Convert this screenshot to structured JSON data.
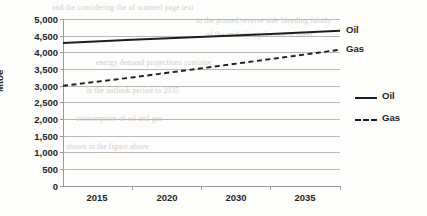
{
  "chart_data": {
    "type": "line",
    "title": "",
    "xlabel": "",
    "ylabel": "Mtoe",
    "x": [
      "2015",
      "2020",
      "2030",
      "2035"
    ],
    "xtick_labels": [
      "2015",
      "2020",
      "2030",
      "2035"
    ],
    "ytick_labels": [
      "5,000",
      "4,500",
      "4,000",
      "3,500",
      "3,000",
      "2,500",
      "2,000",
      "1,500",
      "1,000",
      "500",
      "0"
    ],
    "ylim": [
      0,
      5000
    ],
    "ytick_values": [
      5000,
      4500,
      4000,
      3500,
      3000,
      2500,
      2000,
      1500,
      1000,
      500,
      0
    ],
    "grid": true,
    "legend_position": "right",
    "series": [
      {
        "name": "Oil",
        "style": "solid",
        "color": "#1d1d1d",
        "values": [
          4280,
          4380,
          4550,
          4650
        ],
        "end_label": "Oil"
      },
      {
        "name": "Gas",
        "style": "dashed",
        "color": "#1d1d1d",
        "values": [
          3000,
          3250,
          3800,
          4080
        ],
        "end_label": "Gas"
      }
    ],
    "annotations": [
      {
        "text": "Oil",
        "series": "Oil"
      },
      {
        "text": "Gas",
        "series": "Gas"
      }
    ]
  },
  "legend": {
    "items": [
      {
        "label": "Oil",
        "style": "solid"
      },
      {
        "label": "Gas",
        "style": "dashed"
      }
    ]
  },
  "background_text": [
    "and the considering the of scanned page text",
    "to the printed reverse side bleeding faintly",
    "of the underlying document sheet",
    "energy demand projections continue",
    "in the outlook period to 2035",
    "consumption of oil and gas",
    "shown in the figure above"
  ]
}
